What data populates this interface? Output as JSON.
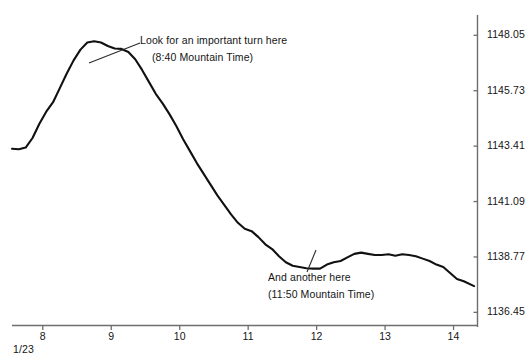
{
  "chart_data": {
    "type": "line",
    "title": "",
    "xlabel": "",
    "ylabel": "",
    "date_label": "1/23",
    "grid": false,
    "legend": "none",
    "xlim": [
      7.55,
      14.35
    ],
    "ylim": [
      1135.9,
      1148.9
    ],
    "x_ticks": [
      "8",
      "9",
      "10",
      "11",
      "12",
      "13",
      "14"
    ],
    "x_tick_values": [
      8,
      9,
      10,
      11,
      12,
      13,
      14
    ],
    "y_ticks": [
      "1148.05",
      "1145.73",
      "1143.41",
      "1141.09",
      "1138.77",
      "1136.45"
    ],
    "y_tick_values": [
      1148.05,
      1145.73,
      1143.41,
      1141.09,
      1138.77,
      1136.45
    ],
    "series": [
      {
        "name": "price",
        "color": "#111111",
        "x": [
          7.55,
          7.65,
          7.75,
          7.85,
          7.95,
          8.05,
          8.15,
          8.25,
          8.35,
          8.45,
          8.55,
          8.65,
          8.75,
          8.85,
          8.95,
          9.05,
          9.15,
          9.25,
          9.35,
          9.45,
          9.55,
          9.65,
          9.75,
          9.85,
          9.95,
          10.05,
          10.15,
          10.25,
          10.35,
          10.45,
          10.55,
          10.65,
          10.75,
          10.85,
          10.95,
          11.05,
          11.15,
          11.25,
          11.35,
          11.45,
          11.55,
          11.65,
          11.75,
          11.85,
          11.95,
          12.05,
          12.15,
          12.25,
          12.35,
          12.45,
          12.55,
          12.65,
          12.75,
          12.85,
          12.95,
          13.05,
          13.15,
          13.25,
          13.35,
          13.45,
          13.55,
          13.65,
          13.75,
          13.85,
          13.95,
          14.05,
          14.15,
          14.3
        ],
        "y": [
          1143.3,
          1143.28,
          1143.35,
          1143.75,
          1144.35,
          1144.85,
          1145.25,
          1145.85,
          1146.45,
          1147.0,
          1147.45,
          1147.75,
          1147.8,
          1147.75,
          1147.6,
          1147.5,
          1147.48,
          1147.35,
          1147.05,
          1146.6,
          1146.1,
          1145.6,
          1145.2,
          1144.75,
          1144.25,
          1143.7,
          1143.2,
          1142.7,
          1142.25,
          1141.8,
          1141.35,
          1140.95,
          1140.55,
          1140.2,
          1139.95,
          1139.85,
          1139.6,
          1139.3,
          1139.1,
          1138.8,
          1138.55,
          1138.4,
          1138.35,
          1138.3,
          1138.28,
          1138.28,
          1138.45,
          1138.55,
          1138.6,
          1138.75,
          1138.9,
          1138.95,
          1138.9,
          1138.85,
          1138.85,
          1138.88,
          1138.82,
          1138.88,
          1138.85,
          1138.8,
          1138.7,
          1138.6,
          1138.45,
          1138.35,
          1138.1,
          1137.85,
          1137.75,
          1137.55
        ]
      }
    ],
    "annotations": [
      {
        "id": "turn",
        "line_1": "Look for an important turn here",
        "line_2": "(8:40 Mountain Time)",
        "leader_from_x": 140,
        "leader_from_y": 43,
        "leader_to_x": 89,
        "leader_to_y": 63
      },
      {
        "id": "another",
        "line_1": "And another here",
        "line_2": "(11:50 Mountain Time)",
        "leader_from_x": 307,
        "leader_from_y": 272,
        "leader_to_x": 316,
        "leader_to_y": 250
      }
    ]
  }
}
